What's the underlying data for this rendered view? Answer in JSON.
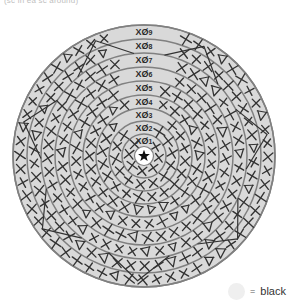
{
  "caption": "(sc in ea sc around)",
  "diagram": {
    "center_marker": "star",
    "ring_fill": "#d9d9d9",
    "ring_stroke": "#808080",
    "stitch_color": "#333333",
    "stitch_symbol": "X",
    "increase_symbol": "V",
    "rounds": [
      {
        "label": "XØ1",
        "number": 1,
        "radius": 22,
        "stitches": 8
      },
      {
        "label": "XØ2",
        "number": 2,
        "radius": 35,
        "stitches": 14
      },
      {
        "label": "XØ3",
        "number": 3,
        "radius": 48,
        "stitches": 20
      },
      {
        "label": "XØ4",
        "number": 4,
        "radius": 61,
        "stitches": 26
      },
      {
        "label": "XØ5",
        "number": 5,
        "radius": 75,
        "stitches": 32
      },
      {
        "label": "XØ6",
        "number": 6,
        "radius": 89,
        "stitches": 38
      },
      {
        "label": "XØ7",
        "number": 7,
        "radius": 103,
        "stitches": 44
      },
      {
        "label": "XØ8",
        "number": 8,
        "radius": 117,
        "stitches": 50
      },
      {
        "label": "XØ9",
        "number": 9,
        "radius": 131,
        "stitches": 56
      }
    ],
    "center": {
      "cx": 144,
      "cy": 156
    }
  },
  "legend": {
    "equals": "=",
    "label": "black",
    "swatch_color": "#efefef"
  }
}
